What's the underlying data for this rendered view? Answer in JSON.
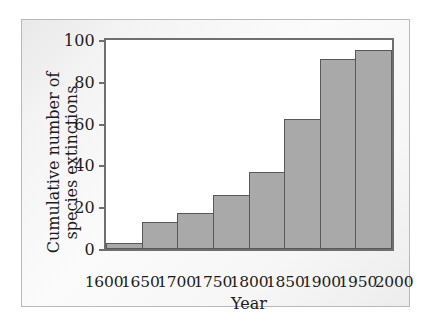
{
  "figure": {
    "frame_border_color": "#b9b9b9",
    "background_color": "#f5f5f5"
  },
  "chart_data": {
    "type": "bar",
    "title": "",
    "subtitle": "",
    "xlabel": "Year",
    "ylabel_line1": "Cumulative number of",
    "ylabel_line2": "species extinctions",
    "ylabel": "Cumulative number of species extinctions",
    "categories": [
      "1600",
      "1650",
      "1700",
      "1750",
      "1800",
      "1850",
      "1900",
      "1950"
    ],
    "values": [
      3,
      13,
      17,
      26,
      37,
      62,
      91,
      95
    ],
    "x_tick_labels": [
      "1600",
      "1650",
      "1700",
      "1750",
      "1800",
      "1850",
      "1900",
      "1950",
      "2000"
    ],
    "y_tick_labels": [
      "0",
      "20",
      "40",
      "60",
      "80",
      "100"
    ],
    "y_tick_values": [
      0,
      20,
      40,
      60,
      80,
      100
    ],
    "ylim": [
      0,
      100
    ],
    "xlim": [
      1600,
      2000
    ],
    "grid": false,
    "legend": "none",
    "bar_fill_color": "#a9a9a9",
    "bar_edge_color": "#585858",
    "axis_color": "#6f6f6f",
    "text_color": "#1c1c1c",
    "plot_background_color": "#ffffff"
  }
}
